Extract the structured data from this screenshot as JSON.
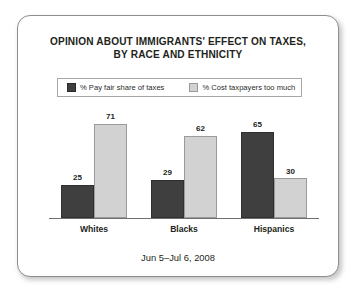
{
  "chart_data": {
    "type": "bar",
    "title": "OPINION ABOUT IMMIGRANTS' EFFECT ON TAXES, BY RACE AND ETHNICITY",
    "title_lines": [
      "OPINION ABOUT IMMIGRANTS' EFFECT ON TAXES,",
      "BY RACE AND ETHNICITY"
    ],
    "categories": [
      "Whites",
      "Blacks",
      "Hispanics"
    ],
    "series": [
      {
        "name": "% Pay fair share of taxes",
        "color": "#3f3f3f",
        "values": [
          25,
          29,
          65
        ]
      },
      {
        "name": "% Cost taxpayers too much",
        "color": "#d2d2d2",
        "values": [
          71,
          62,
          30
        ]
      }
    ],
    "ylim": [
      0,
      80
    ],
    "ylabel": "",
    "xlabel": "",
    "grid": false,
    "legend_position": "top",
    "data_labels": true,
    "footnote": "Jun 5–Jul 6, 2008"
  },
  "legend": {
    "items": [
      {
        "label": "% Pay fair share of taxes",
        "swatch": "dark"
      },
      {
        "label": "% Cost taxpayers too much",
        "swatch": "light"
      }
    ]
  },
  "footer": {
    "date_range": "Jun 5–Jul 6, 2008"
  }
}
